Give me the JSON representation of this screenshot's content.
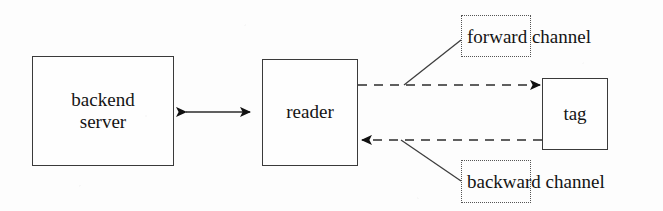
{
  "diagram": {
    "background_color": "#fdfdfd",
    "stroke_color": "#3a3a3a",
    "text_color": "#141414",
    "nodes": [
      {
        "id": "backend-server",
        "label": "backend\nserver",
        "shape": "rectangle",
        "border": "solid"
      },
      {
        "id": "reader",
        "label": "reader",
        "shape": "rectangle",
        "border": "solid"
      },
      {
        "id": "tag",
        "label": "tag",
        "shape": "rectangle",
        "border": "solid"
      }
    ],
    "edges": [
      {
        "id": "backend-reader-link",
        "from": "backend-server",
        "to": "reader",
        "style": "solid",
        "arrowheads": "both",
        "label": ""
      },
      {
        "id": "forward-channel-edge",
        "from": "reader",
        "to": "tag",
        "style": "dashed",
        "arrowheads": "end",
        "label": "forward channel"
      },
      {
        "id": "backward-channel-edge",
        "from": "tag",
        "to": "reader",
        "style": "dashed",
        "arrowheads": "end",
        "label": "backward channel"
      }
    ],
    "callouts": [
      {
        "id": "forward-channel",
        "text": "forward channel",
        "border": "dotted",
        "points_to": "forward-channel-edge"
      },
      {
        "id": "backward-channel",
        "text": "backward channel",
        "border": "dotted",
        "points_to": "backward-channel-edge"
      }
    ]
  }
}
